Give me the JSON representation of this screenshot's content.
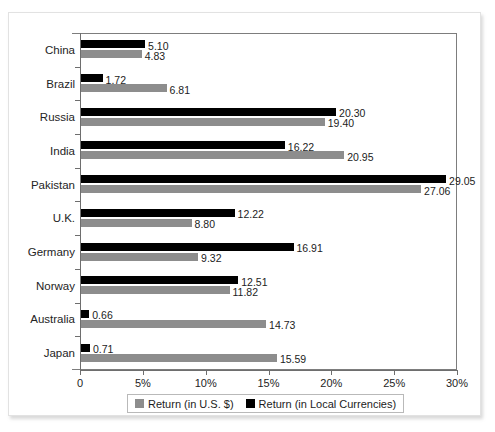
{
  "chart_data": {
    "type": "bar",
    "orientation": "horizontal",
    "title": "",
    "xlabel": "",
    "ylabel": "",
    "xlim": [
      0,
      30
    ],
    "xticks": [
      0,
      5,
      10,
      15,
      20,
      25,
      30
    ],
    "xtick_labels": [
      "0",
      "5%",
      "10%",
      "15%",
      "20%",
      "25%",
      "30%"
    ],
    "grid": false,
    "legend_position": "bottom",
    "categories": [
      "China",
      "Brazil",
      "Russia",
      "India",
      "Pakistan",
      "U.K.",
      "Germany",
      "Norway",
      "Australia",
      "Japan"
    ],
    "series": [
      {
        "name": "Return (in Local Currencies)",
        "color": "#000000",
        "values": [
          5.1,
          1.72,
          20.3,
          16.22,
          29.05,
          12.22,
          16.91,
          12.51,
          0.66,
          0.71
        ],
        "labels": [
          "5.10",
          "1.72",
          "20.30",
          "16.22",
          "29.05",
          "12.22",
          "16.91",
          "12.51",
          "0.66",
          "0.71"
        ]
      },
      {
        "name": "Return (in U.S. $)",
        "color": "#8d8d8d",
        "values": [
          4.83,
          6.81,
          19.4,
          20.95,
          27.06,
          8.8,
          9.32,
          11.82,
          14.73,
          15.59
        ],
        "labels": [
          "4.83",
          "6.81",
          "19.40",
          "20.95",
          "27.06",
          "8.80",
          "9.32",
          "11.82",
          "14.73",
          "15.59"
        ]
      }
    ]
  },
  "legend": {
    "items": [
      {
        "label": "Return (in U.S. $)",
        "color": "#8d8d8d"
      },
      {
        "label": "Return (in Local Currencies)",
        "color": "#000000"
      }
    ]
  },
  "colors": {
    "local": "#000000",
    "usd": "#8d8d8d",
    "axis": "#6e6e6e",
    "frame": "#7d7d7d",
    "card_border": "#e2e2e2"
  }
}
